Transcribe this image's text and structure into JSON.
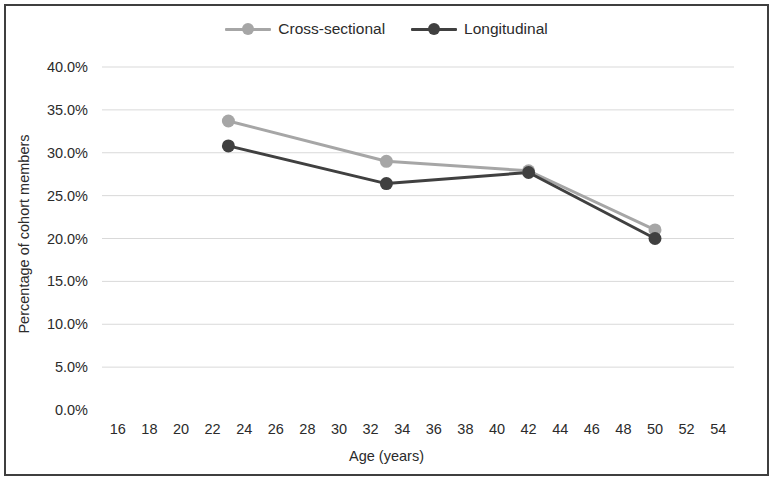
{
  "chart_data": {
    "type": "line",
    "title": "",
    "xlabel": "Age (years)",
    "ylabel": "Percentage of cohort members",
    "x": [
      23,
      33,
      42,
      50
    ],
    "xlim": [
      15,
      55
    ],
    "ylim": [
      0,
      40
    ],
    "xticks": [
      16,
      18,
      20,
      22,
      24,
      26,
      28,
      30,
      32,
      34,
      36,
      38,
      40,
      42,
      44,
      46,
      48,
      50,
      52,
      54
    ],
    "xticklabels": [
      "16",
      "18",
      "20",
      "22",
      "24",
      "26",
      "28",
      "30",
      "32",
      "34",
      "36",
      "38",
      "40",
      "42",
      "44",
      "46",
      "48",
      "50",
      "52",
      "54"
    ],
    "yticks": [
      0,
      5,
      10,
      15,
      20,
      25,
      30,
      35,
      40
    ],
    "yticklabels": [
      "0.0%",
      "5.0%",
      "10.0%",
      "15.0%",
      "20.0%",
      "25.0%",
      "30.0%",
      "35.0%",
      "40.0%"
    ],
    "grid": "horizontal",
    "legend_position": "top-center",
    "series": [
      {
        "name": "Cross-sectional",
        "color": "#a6a6a6",
        "values": [
          33.7,
          29.0,
          27.9,
          21.0
        ]
      },
      {
        "name": "Longitudinal",
        "color": "#404040",
        "values": [
          30.8,
          26.4,
          27.7,
          20.0
        ]
      }
    ]
  },
  "legend": {
    "entries": [
      {
        "label": "Cross-sectional"
      },
      {
        "label": "Longitudinal"
      }
    ]
  },
  "axes": {
    "x_title": "Age (years)",
    "y_title": "Percentage of cohort members"
  },
  "style": {
    "border_color": "#3f3f3f",
    "grid_color": "#d9d9d9",
    "background": "#ffffff"
  }
}
